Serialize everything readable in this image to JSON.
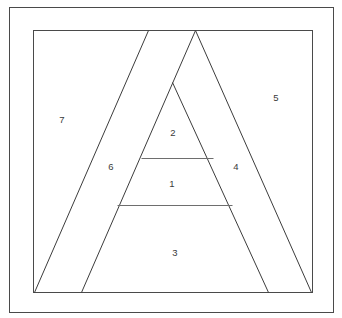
{
  "figure": {
    "canvas": {
      "width": 342,
      "height": 318
    },
    "background_color": "#ffffff",
    "stroke_color": "#3c3c3c",
    "label_color": "#3a3a3a"
  },
  "frames": [
    {
      "name": "outer-border",
      "x": 9,
      "y": 7,
      "width": 324,
      "height": 305,
      "stroke": "#5a5a5a"
    },
    {
      "name": "inner-border",
      "x": 33,
      "y": 30,
      "width": 279,
      "height": 262,
      "stroke": "#4a4a4a"
    }
  ],
  "segments": [
    {
      "name": "outer-left-band-edge",
      "x1": 148,
      "y1": 30,
      "x2": 34,
      "y2": 292
    },
    {
      "name": "triangle-left-side",
      "x1": 195,
      "y1": 30,
      "x2": 81,
      "y2": 292
    },
    {
      "name": "triangle-right-side",
      "x1": 195,
      "y1": 30,
      "x2": 311,
      "y2": 292
    },
    {
      "name": "inner-triangle-right",
      "x1": 172,
      "y1": 82,
      "x2": 268,
      "y2": 292
    },
    {
      "name": "upper-crossbar",
      "x1": 141,
      "y1": 158,
      "x2": 213,
      "y2": 158
    },
    {
      "name": "lower-crossbar",
      "x1": 117,
      "y1": 205,
      "x2": 232,
      "y2": 205
    }
  ],
  "labels": [
    {
      "id": "region-1",
      "text": "1",
      "x": 172,
      "y": 184
    },
    {
      "id": "region-2",
      "text": "2",
      "x": 173,
      "y": 133
    },
    {
      "id": "region-3",
      "text": "3",
      "x": 175,
      "y": 253
    },
    {
      "id": "region-4",
      "text": "4",
      "x": 236,
      "y": 167
    },
    {
      "id": "region-5",
      "text": "5",
      "x": 276,
      "y": 98
    },
    {
      "id": "region-6",
      "text": "6",
      "x": 111,
      "y": 167
    },
    {
      "id": "region-7",
      "text": "7",
      "x": 62,
      "y": 120
    }
  ]
}
